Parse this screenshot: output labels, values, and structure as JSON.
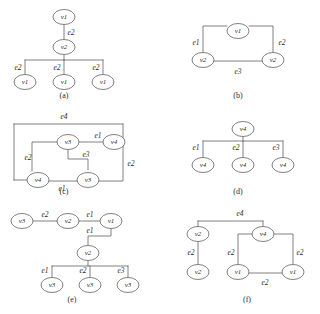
{
  "figure": {
    "background_color": "#ffffff",
    "stroke_color": "#4a4a4a",
    "text_color": "#2b2b2b",
    "width": 320,
    "height": 314,
    "panel_count": 6
  },
  "panels": [
    {
      "id": "a",
      "caption": "(a)",
      "caption_x": 64,
      "caption_y": 96,
      "kind": "tree",
      "nodes": [
        {
          "name": "a-root",
          "label": "v1",
          "cx": 64,
          "cy": 17
        },
        {
          "name": "a-mid",
          "label": "v2",
          "cx": 64,
          "cy": 47
        },
        {
          "name": "a-leaf1",
          "label": "v1",
          "cx": 25,
          "cy": 82
        },
        {
          "name": "a-leaf2",
          "label": "v1",
          "cx": 64,
          "cy": 82
        },
        {
          "name": "a-leaf3",
          "label": "v1",
          "cx": 103,
          "cy": 82
        }
      ],
      "edges": [
        {
          "name": "a-edge-root-mid",
          "label": "e2",
          "lx": 71,
          "ly": 33,
          "path": "M 64 25 L 64 39"
        },
        {
          "name": "a-edge-mid-leaf1",
          "label": "e2",
          "lx": 18,
          "ly": 68,
          "path": "M 64 55 L 64 60 M 25 60 L 103 60 M 25 60 L 25 74"
        },
        {
          "name": "a-edge-mid-leaf2",
          "label": "e2",
          "lx": 57,
          "ly": 68,
          "path": "M 64 60 L 64 74"
        },
        {
          "name": "a-edge-mid-leaf3",
          "label": "e2",
          "lx": 96,
          "ly": 68,
          "path": "M 103 60 L 103 74"
        }
      ]
    },
    {
      "id": "b",
      "caption": "(b)",
      "caption_x": 238,
      "caption_y": 96,
      "kind": "cycle",
      "nodes": [
        {
          "name": "b-top",
          "label": "v1",
          "cx": 238,
          "cy": 31
        },
        {
          "name": "b-bottom-left",
          "label": "v2",
          "cx": 203,
          "cy": 60
        },
        {
          "name": "b-bottom-right",
          "label": "v2",
          "cx": 273,
          "cy": 60
        }
      ],
      "edges": [
        {
          "name": "b-edge-left",
          "label": "e1",
          "lx": 196,
          "ly": 43,
          "path": "M 227 26 L 203 26 L 203 52"
        },
        {
          "name": "b-edge-right",
          "label": "e2",
          "lx": 282,
          "ly": 43,
          "path": "M 249 26 L 273 26 L 273 52"
        },
        {
          "name": "b-edge-bottom",
          "label": "e3",
          "lx": 238,
          "ly": 72,
          "path": "M 214 61 L 262 61"
        }
      ]
    },
    {
      "id": "c",
      "caption": "(c)",
      "caption_x": 64,
      "caption_y": 192,
      "kind": "cycle-with-chord",
      "nodes": [
        {
          "name": "c-top-left",
          "label": "v3",
          "cx": 68,
          "cy": 142
        },
        {
          "name": "c-top-right",
          "label": "v4",
          "cx": 114,
          "cy": 142
        },
        {
          "name": "c-bottom-left",
          "label": "v4",
          "cx": 38,
          "cy": 180
        },
        {
          "name": "c-bottom-right",
          "label": "v3",
          "cx": 88,
          "cy": 180
        }
      ],
      "edges": [
        {
          "name": "c-edge-outer-e4",
          "label": "e4",
          "lx": 64,
          "ly": 117,
          "path": "M 14 124 L 123 124 M 14 124 L 14 180 M 14 180 L 27 180 M 123 124 L 123 142"
        },
        {
          "name": "c-edge-e1-top",
          "label": "e1",
          "lx": 98,
          "ly": 136,
          "path": "M 79 142 L 103 142"
        },
        {
          "name": "c-edge-e3",
          "label": "e3",
          "lx": 86,
          "ly": 155,
          "path": "M 68 150 L 68 159 L 88 159 L 88 170"
        },
        {
          "name": "c-edge-e2-left",
          "label": "e2",
          "lx": 28,
          "ly": 158,
          "path": "M 57 142 L 32 142 L 32 171"
        },
        {
          "name": "c-edge-e2-right",
          "label": "e2",
          "lx": 131,
          "ly": 164,
          "path": "M 123 142 L 123 181 L 99 181"
        },
        {
          "name": "c-edge-e1-bottom",
          "label": "e1",
          "lx": 62,
          "ly": 189,
          "path": "M 49 181 L 77 181"
        }
      ]
    },
    {
      "id": "d",
      "caption": "(d)",
      "caption_x": 238,
      "caption_y": 192,
      "kind": "star",
      "nodes": [
        {
          "name": "d-root",
          "label": "v4",
          "cx": 243,
          "cy": 129
        },
        {
          "name": "d-leaf1",
          "label": "v4",
          "cx": 203,
          "cy": 165
        },
        {
          "name": "d-leaf2",
          "label": "v4",
          "cx": 243,
          "cy": 165
        },
        {
          "name": "d-leaf3",
          "label": "v4",
          "cx": 283,
          "cy": 165
        }
      ],
      "edges": [
        {
          "name": "d-edge-e1",
          "label": "e1",
          "lx": 196,
          "ly": 148,
          "path": "M 203 141 L 283 141 M 243 137 L 243 141 M 203 141 L 203 157"
        },
        {
          "name": "d-edge-e2",
          "label": "e2",
          "lx": 236,
          "ly": 148,
          "path": "M 243 141 L 243 157"
        },
        {
          "name": "d-edge-e3",
          "label": "e3",
          "lx": 276,
          "ly": 148,
          "path": "M 283 141 L 283 157"
        }
      ]
    },
    {
      "id": "e",
      "caption": "(e)",
      "caption_x": 72,
      "caption_y": 300,
      "kind": "tree-with-chain",
      "nodes": [
        {
          "name": "e-chain-left",
          "label": "v3",
          "cx": 22,
          "cy": 221
        },
        {
          "name": "e-chain-mid",
          "label": "v2",
          "cx": 68,
          "cy": 221
        },
        {
          "name": "e-chain-right",
          "label": "v1",
          "cx": 111,
          "cy": 221
        },
        {
          "name": "e-hub",
          "label": "v2",
          "cx": 88,
          "cy": 253
        },
        {
          "name": "e-leaf1",
          "label": "v3",
          "cx": 52,
          "cy": 285
        },
        {
          "name": "e-leaf2",
          "label": "v3",
          "cx": 90,
          "cy": 285
        },
        {
          "name": "e-leaf3",
          "label": "v3",
          "cx": 128,
          "cy": 285
        }
      ],
      "edges": [
        {
          "name": "e-edge-e2-chain",
          "label": "e2",
          "lx": 45,
          "ly": 215,
          "path": "M 33 221 L 57 221"
        },
        {
          "name": "e-edge-e1-chain",
          "label": "e1",
          "lx": 90,
          "ly": 215,
          "path": "M 79 221 L 100 221"
        },
        {
          "name": "e-edge-e1-down",
          "label": "e1",
          "lx": 90,
          "ly": 231,
          "path": "M 111 229 L 111 236 L 88 236 L 88 245"
        },
        {
          "name": "e-edge-e1-leaf",
          "label": "e1",
          "lx": 45,
          "ly": 271,
          "path": "M 88 261 L 88 266 M 52 266 L 128 266 M 52 266 L 52 277"
        },
        {
          "name": "e-edge-e2-leaf",
          "label": "e2",
          "lx": 83,
          "ly": 271,
          "path": "M 90 266 L 90 277"
        },
        {
          "name": "e-edge-e3-leaf",
          "label": "e3",
          "lx": 121,
          "ly": 271,
          "path": "M 128 266 L 128 277"
        }
      ]
    },
    {
      "id": "f",
      "caption": "(f)",
      "caption_x": 247,
      "caption_y": 300,
      "kind": "mixed",
      "nodes": [
        {
          "name": "f-left-top",
          "label": "v2",
          "cx": 198,
          "cy": 234
        },
        {
          "name": "f-left-bottom",
          "label": "v2",
          "cx": 198,
          "cy": 272
        },
        {
          "name": "f-hub",
          "label": "v4",
          "cx": 263,
          "cy": 234
        },
        {
          "name": "f-right-bottom",
          "label": "v1",
          "cx": 293,
          "cy": 272
        },
        {
          "name": "f-mid-bottom",
          "label": "v1",
          "cx": 238,
          "cy": 272
        }
      ],
      "edges": [
        {
          "name": "f-edge-e4",
          "label": "e4",
          "lx": 240,
          "ly": 214,
          "path": "M 198 221 L 263 221 M 198 221 L 198 226 M 263 221 L 263 226"
        },
        {
          "name": "f-edge-e2-left",
          "label": "e2",
          "lx": 191,
          "ly": 253,
          "path": "M 198 242 L 198 264"
        },
        {
          "name": "f-edge-e2-mid",
          "label": "e2",
          "lx": 231,
          "ly": 253,
          "path": "M 252 234 L 238 234 L 238 264"
        },
        {
          "name": "f-edge-e2-right",
          "label": "e2",
          "lx": 300,
          "ly": 253,
          "path": "M 274 234 L 293 234 L 293 264"
        },
        {
          "name": "f-edge-e2-bottom",
          "label": "e2",
          "lx": 265,
          "ly": 283,
          "path": "M 249 273 L 282 273"
        }
      ]
    }
  ]
}
